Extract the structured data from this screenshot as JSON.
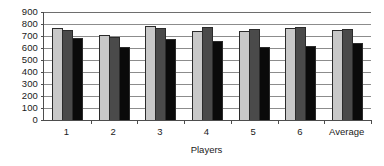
{
  "chart_data": {
    "type": "bar",
    "title": "",
    "subtitle": "",
    "xlabel": "Players",
    "ylabel": "",
    "categories": [
      "1",
      "2",
      "3",
      "4",
      "5",
      "6",
      "Average"
    ],
    "series": [
      {
        "name": "series-1",
        "color": "#c8c8c8",
        "values": [
          765,
          710,
          782,
          742,
          740,
          763,
          752
        ]
      },
      {
        "name": "series-2",
        "color": "#4a4a4a",
        "values": [
          750,
          695,
          763,
          775,
          755,
          778,
          758
        ]
      },
      {
        "name": "series-3",
        "color": "#0a0a0a",
        "values": [
          683,
          612,
          672,
          660,
          612,
          615,
          645
        ]
      }
    ],
    "ylim": [
      0,
      900
    ],
    "ytick_step": 100,
    "yticks": [
      900,
      800,
      700,
      600,
      500,
      400,
      300,
      200,
      100,
      0
    ],
    "grid": true,
    "grid_axis": "y",
    "legend": false,
    "legend_position": "none",
    "bar_outline_color": "#2b2b2b",
    "axis_color": "#4d4d4d",
    "gridline_color": "#8c8c8c",
    "background": "#ffffff"
  }
}
